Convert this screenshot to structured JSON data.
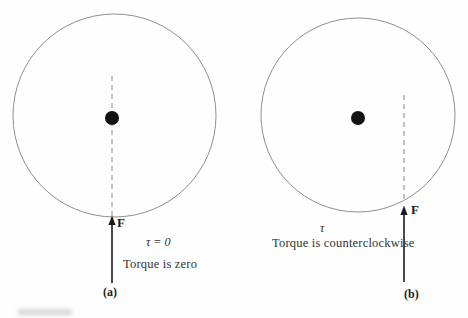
{
  "figure": {
    "name": "torque-on-disk-diagram",
    "background": "#fefefe"
  },
  "colors": {
    "circle_stroke": "#8f8f8f",
    "dashed_line": "#9a9a9a",
    "pivot_dot": "#121212",
    "arrow": "#1c1c1c",
    "text": "#2b2b2b"
  },
  "panels": [
    {
      "id": "a",
      "force_label": "F",
      "torque_label": "τ = 0",
      "caption": "Torque is zero",
      "panel_label": "(a)"
    },
    {
      "id": "b",
      "force_label": "F",
      "torque_label": "τ",
      "caption": "Torque is counterclockwise",
      "panel_label": "(b)"
    }
  ]
}
